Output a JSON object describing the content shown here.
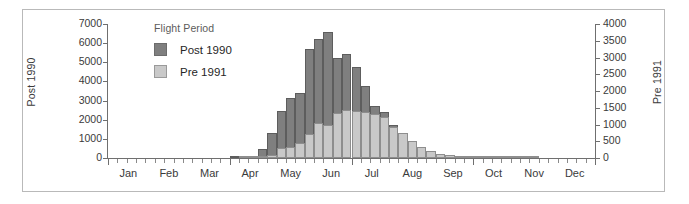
{
  "chart_data": {
    "type": "bar",
    "subtype": "stacked-histogram-dual-axis",
    "title": "",
    "xlabel": "",
    "legend_title": "Flight Period",
    "legend_position": "inside-upper-left",
    "grid": false,
    "axes": {
      "left": {
        "label": "Post 1990",
        "series": "Post 1990",
        "ylim": [
          0,
          7000
        ],
        "ticks": [
          0,
          1000,
          2000,
          3000,
          4000,
          5000,
          6000,
          7000
        ],
        "tick_labels": [
          "0",
          "1000",
          "2000",
          "3000",
          "4000",
          "5000",
          "6000",
          "7000"
        ]
      },
      "right": {
        "label": "Pre 1991",
        "series": "Pre 1991",
        "ylim": [
          0,
          4000
        ],
        "ticks": [
          0,
          500,
          1000,
          1500,
          2000,
          2500,
          3000,
          3500,
          4000
        ],
        "tick_labels": [
          "0",
          "500",
          "1000",
          "1500",
          "2000",
          "2500",
          "3000",
          "3500",
          "4000"
        ]
      }
    },
    "x_months": [
      "Jan",
      "Feb",
      "Mar",
      "Apr",
      "May",
      "Jun",
      "Jul",
      "Aug",
      "Sep",
      "Oct",
      "Nov",
      "Dec"
    ],
    "x_unit": "week",
    "x_bins": 52,
    "series": [
      {
        "name": "Post 1990",
        "color": "#7f7f7f",
        "axis": "left",
        "values": [
          0,
          0,
          0,
          0,
          0,
          0,
          0,
          0,
          0,
          0,
          0,
          0,
          0,
          20,
          60,
          130,
          470,
          1290,
          2470,
          3150,
          3420,
          5700,
          6200,
          6600,
          5200,
          5450,
          4750,
          3750,
          2700,
          2400,
          1700,
          1150,
          700,
          420,
          260,
          170,
          110,
          70,
          45,
          30,
          20,
          12,
          8,
          5,
          3,
          2,
          0,
          0,
          0,
          0,
          0,
          0
        ]
      },
      {
        "name": "Pre 1991",
        "color": "#c9c9c9",
        "axis": "right",
        "values": [
          0,
          0,
          0,
          0,
          0,
          0,
          0,
          0,
          0,
          0,
          0,
          0,
          0,
          0,
          10,
          40,
          60,
          90,
          300,
          330,
          450,
          730,
          1060,
          980,
          1330,
          1430,
          1410,
          1380,
          1300,
          1220,
          940,
          760,
          500,
          330,
          200,
          130,
          80,
          55,
          35,
          22,
          14,
          9,
          6,
          4,
          2,
          1,
          0,
          0,
          0,
          0,
          0,
          0
        ]
      }
    ]
  },
  "legend": {
    "title": "Flight Period",
    "items": [
      {
        "label": "Post 1990",
        "color": "#7f7f7f"
      },
      {
        "label": "Pre 1991",
        "color": "#c9c9c9"
      }
    ]
  },
  "colors": {
    "post_1990": "#7f7f7f",
    "pre_1991": "#c9c9c9",
    "axis": "#6f6f6f",
    "frame": "#b9b9b9",
    "text": "#3a3a3a"
  }
}
